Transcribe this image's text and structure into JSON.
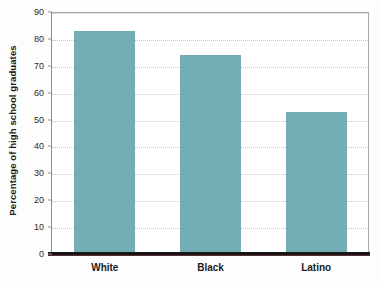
{
  "chart_data": {
    "type": "bar",
    "title": "",
    "subtitle": "",
    "xlabel": "",
    "ylabel": "Percentage of high school graduates",
    "categories": [
      "White",
      "Black",
      "Latino"
    ],
    "values": [
      83,
      74,
      53
    ],
    "series": [
      {
        "name": "Percentage of high school graduates",
        "values": [
          83,
          74,
          53
        ]
      }
    ],
    "ylim": [
      0,
      90
    ],
    "ytick_interval": 10,
    "ytick_labels": [
      "0",
      "10",
      "20",
      "30",
      "40",
      "50",
      "60",
      "70",
      "80",
      "90"
    ],
    "ytick_values": [
      0,
      10,
      20,
      30,
      40,
      50,
      60,
      70,
      80,
      90
    ],
    "grid": "horizontal-dotted",
    "legend": "none",
    "annotations": [],
    "colors": {
      "bar_fill": "#74aeb4",
      "gridline": "#c4c4c4",
      "axis_line": "#8d8d8d",
      "plot_border": "#a9a9a9",
      "baseline": "#17171a",
      "plot_background": "#ffffff",
      "figure_background": "#fdfdfd",
      "text": "#1a1a1a"
    }
  }
}
